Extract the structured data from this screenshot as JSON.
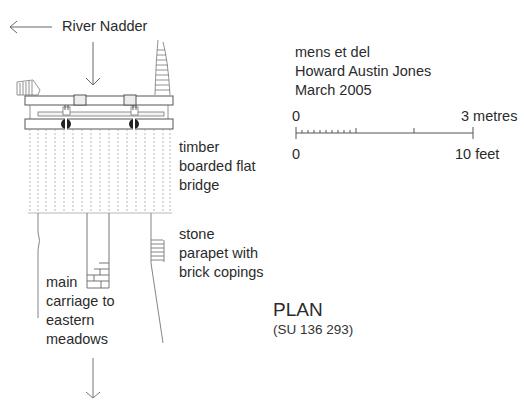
{
  "diagram": {
    "type": "architectural plan drawing",
    "title": "PLAN",
    "grid_reference": "(SU 136 293)",
    "credits": {
      "line1": "mens et del",
      "line2": "Howard Austin Jones",
      "line3": "March 2005"
    },
    "scale_bar": {
      "metric_start": "0",
      "metric_end": "3 metres",
      "imperial_start": "0",
      "imperial_end": "10 feet"
    },
    "labels": {
      "river": "River Nadder",
      "bridge": [
        "timber",
        "boarded flat",
        "bridge"
      ],
      "parapet": [
        "stone",
        "parapet with",
        "brick copings"
      ],
      "carriage": [
        "main",
        "carriage to",
        "eastern",
        "meadows"
      ]
    },
    "colors": {
      "ink": "#3a3a3a",
      "light_ink": "#9a9a9a",
      "background": "#ffffff"
    }
  }
}
